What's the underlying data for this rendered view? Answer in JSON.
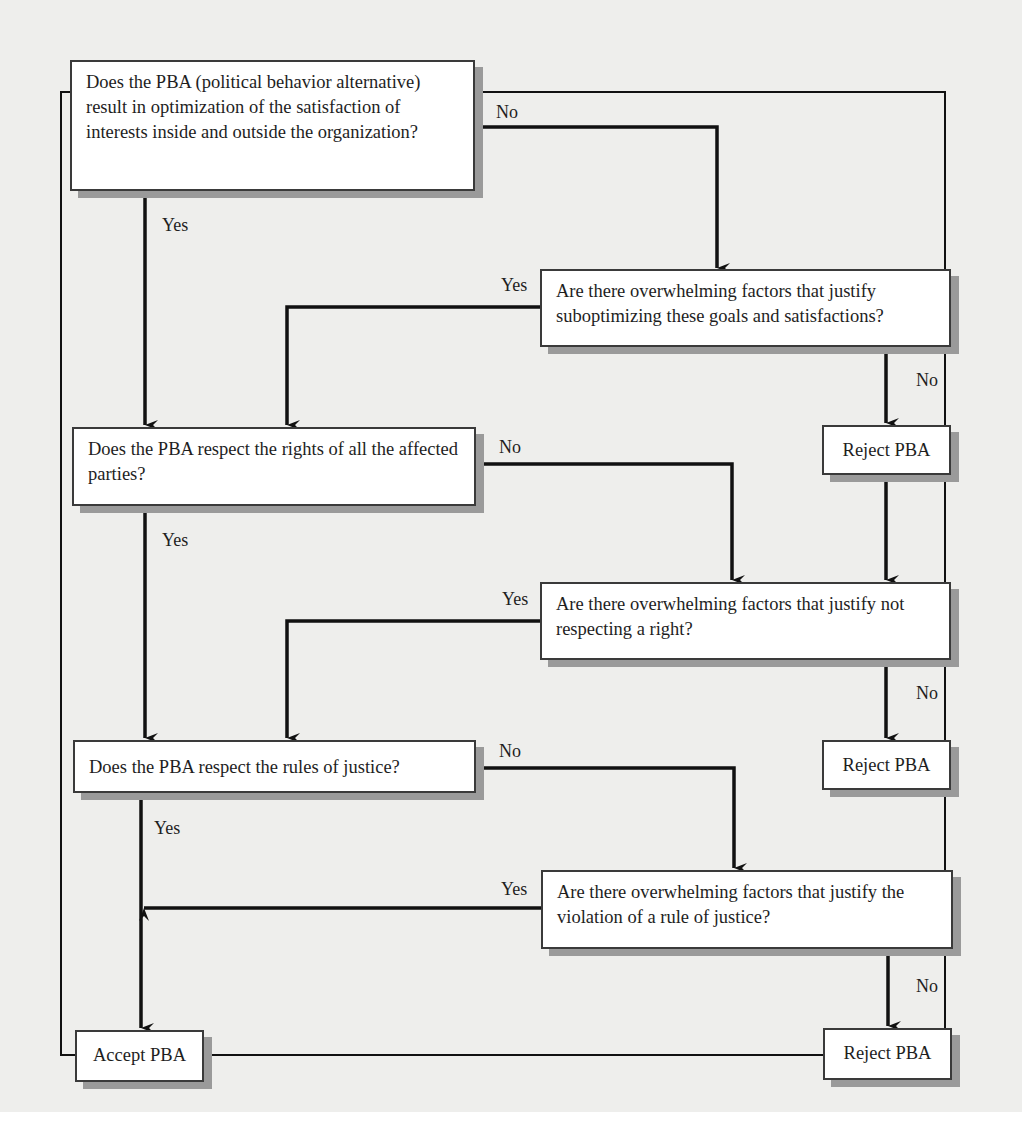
{
  "diagram": {
    "type": "flowchart",
    "background_color": "#eeeeec",
    "nodes": {
      "q1": {
        "text": "Does the PBA (political behavior alternative) result in optimization of the satisfaction of interests inside and outside the organization?"
      },
      "q1b": {
        "text": "Are there overwhelming factors that justify suboptimizing these goals and satisfactions?"
      },
      "reject1": {
        "text": "Reject PBA"
      },
      "q2": {
        "text": "Does the PBA respect the rights of all the affected parties?"
      },
      "q2b": {
        "text": "Are there overwhelming factors that justify not respecting a right?"
      },
      "reject2": {
        "text": "Reject PBA"
      },
      "q3": {
        "text": "Does the PBA respect the rules of justice?"
      },
      "q3b": {
        "text": "Are there overwhelming factors that justify the violation of a rule of justice?"
      },
      "accept": {
        "text": "Accept PBA"
      },
      "reject3": {
        "text": "Reject PBA"
      }
    },
    "edge_labels": {
      "q1_no": "No",
      "q1_yes": "Yes",
      "q1b_yes": "Yes",
      "q1b_no": "No",
      "q2_no": "No",
      "q2_yes": "Yes",
      "q2b_yes": "Yes",
      "q2b_no": "No",
      "q3_no": "No",
      "q3_yes": "Yes",
      "q3b_yes": "Yes",
      "q3b_no": "No"
    },
    "edges": [
      {
        "from": "q1",
        "to": "q2",
        "label": "Yes"
      },
      {
        "from": "q1",
        "to": "q1b",
        "label": "No"
      },
      {
        "from": "q1b",
        "to": "q2",
        "label": "Yes"
      },
      {
        "from": "q1b",
        "to": "reject1",
        "label": "No"
      },
      {
        "from": "reject1",
        "to": "q2b",
        "label": ""
      },
      {
        "from": "q2",
        "to": "q3",
        "label": "Yes"
      },
      {
        "from": "q2",
        "to": "q2b",
        "label": "No"
      },
      {
        "from": "q2b",
        "to": "q3",
        "label": "Yes"
      },
      {
        "from": "q2b",
        "to": "reject2",
        "label": "No"
      },
      {
        "from": "q3",
        "to": "accept",
        "label": "Yes"
      },
      {
        "from": "q3",
        "to": "q3b",
        "label": "No"
      },
      {
        "from": "q3b",
        "to": "accept",
        "label": "Yes"
      },
      {
        "from": "q3b",
        "to": "reject3",
        "label": "No"
      },
      {
        "from": "accept",
        "to": "reject3",
        "label": ""
      },
      {
        "from": "q1",
        "to": "accept",
        "label": ""
      },
      {
        "from": "q1",
        "to": "reject3",
        "label": ""
      }
    ]
  }
}
